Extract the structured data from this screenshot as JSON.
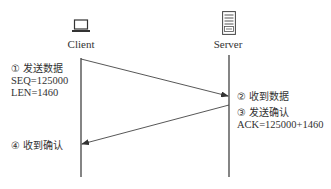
{
  "diagram": {
    "type": "sequence",
    "participants": [
      {
        "id": "client",
        "label": "Client",
        "icon": "laptop-icon"
      },
      {
        "id": "server",
        "label": "Server",
        "icon": "server-icon"
      }
    ],
    "messages": [
      {
        "from": "client",
        "to": "server",
        "step": 1
      },
      {
        "from": "server",
        "to": "client",
        "step": 3
      }
    ],
    "annotations": {
      "step1": {
        "title": "① 发送数据",
        "line1": "SEQ=125000",
        "line2": "LEN=1460"
      },
      "step2": {
        "title": "② 收到数据"
      },
      "step3": {
        "title": "③ 发送确认",
        "line1": "ACK=125000+1460"
      },
      "step4": {
        "title": "④ 收到确认"
      }
    },
    "colors": {
      "line": "#333333",
      "text": "#333333",
      "background": "#ffffff"
    }
  }
}
